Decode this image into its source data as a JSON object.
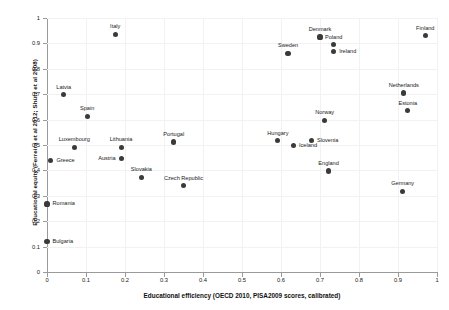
{
  "chart_data": {
    "type": "scatter",
    "title": "",
    "xlabel": "Educational efficiency (OECD 2010, PISA2009 scores, calibrated)",
    "ylabel": "Educational equity (Ferreira et al 2012; Shütz et al 2008)",
    "xlim": [
      0,
      1
    ],
    "ylim": [
      0,
      1
    ],
    "grid": true,
    "legend": "none",
    "xticks": [
      "0",
      "0.1",
      "0.2",
      "0.3",
      "0.4",
      "0.5",
      "0.6",
      "0.7",
      "0.8",
      "0.9",
      "1"
    ],
    "yticks": [
      "0",
      "0.1",
      "0.2",
      "0.3",
      "0.4",
      "0.5",
      "0.6",
      "0.7",
      "0.8",
      "0.9",
      "1"
    ],
    "xtick_values": [
      0,
      0.1,
      0.2,
      0.3,
      0.4,
      0.5,
      0.6,
      0.7,
      0.8,
      0.9,
      1
    ],
    "ytick_values": [
      0,
      0.1,
      0.2,
      0.3,
      0.4,
      0.5,
      0.6,
      0.7,
      0.8,
      0.9,
      1
    ],
    "marker_color": "#3a3a3a",
    "points": [
      {
        "label": "Italy",
        "x": 0.175,
        "y": 0.935,
        "lab": "lab-top"
      },
      {
        "label": "Denmark",
        "x": 0.7,
        "y": 0.925,
        "lab": "lab-top"
      },
      {
        "label": "Finland",
        "x": 0.97,
        "y": 0.93,
        "lab": "lab-top"
      },
      {
        "label": "Poland",
        "x": 0.735,
        "y": 0.895,
        "lab": "lab-top"
      },
      {
        "label": "Sweden",
        "x": 0.618,
        "y": 0.86,
        "lab": "lab-top"
      },
      {
        "label": "Ireland",
        "x": 0.735,
        "y": 0.868,
        "lab": "lab-right"
      },
      {
        "label": "Netherlands",
        "x": 0.915,
        "y": 0.705,
        "lab": "lab-top"
      },
      {
        "label": "Latvia",
        "x": 0.043,
        "y": 0.698,
        "lab": "lab-top"
      },
      {
        "label": "Estonia",
        "x": 0.925,
        "y": 0.635,
        "lab": "lab-top"
      },
      {
        "label": "Spain",
        "x": 0.103,
        "y": 0.613,
        "lab": "lab-top"
      },
      {
        "label": "Portugal",
        "x": 0.325,
        "y": 0.512,
        "lab": "lab-top"
      },
      {
        "label": "Hungary",
        "x": 0.592,
        "y": 0.517,
        "lab": "lab-top"
      },
      {
        "label": "Slovenia",
        "x": 0.678,
        "y": 0.518,
        "lab": "lab-right"
      },
      {
        "label": "Iceland",
        "x": 0.632,
        "y": 0.498,
        "lab": "lab-right"
      },
      {
        "label": "Norway",
        "x": 0.712,
        "y": 0.598,
        "lab": "lab-top"
      },
      {
        "label": "Luxembourg",
        "x": 0.07,
        "y": 0.49,
        "lab": "lab-top"
      },
      {
        "label": "Lithuania",
        "x": 0.19,
        "y": 0.49,
        "lab": "lab-top"
      },
      {
        "label": "Austria",
        "x": 0.19,
        "y": 0.448,
        "lab": "lab-left"
      },
      {
        "label": "Greece",
        "x": 0.01,
        "y": 0.44,
        "lab": "lab-right"
      },
      {
        "label": "England",
        "x": 0.722,
        "y": 0.398,
        "lab": "lab-top"
      },
      {
        "label": "Slovakia",
        "x": 0.242,
        "y": 0.372,
        "lab": "lab-top"
      },
      {
        "label": "Czech Republic",
        "x": 0.35,
        "y": 0.34,
        "lab": "lab-top"
      },
      {
        "label": "Germany",
        "x": 0.912,
        "y": 0.318,
        "lab": "lab-top"
      },
      {
        "label": "Romania",
        "x": 0.0,
        "y": 0.268,
        "lab": "lab-right"
      },
      {
        "label": "Bulgaria",
        "x": 0.0,
        "y": 0.12,
        "lab": "lab-right"
      }
    ]
  }
}
